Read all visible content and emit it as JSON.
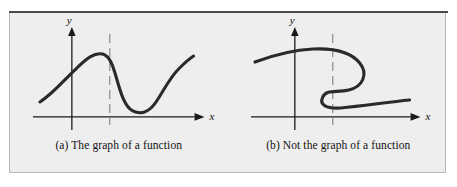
{
  "figure": {
    "background_color": "#eeeeee",
    "frame_border_color": "#b9b9b9",
    "top_rule_color": "#4a4a4a",
    "curve_color": "#2a2a2a",
    "axis_color": "#1a1a1a",
    "dashed_line_color": "#8a8a8a"
  },
  "panels": [
    {
      "id": "panel-a",
      "caption": "(a) The graph of a function",
      "x_axis_label": "x",
      "y_axis_label": "y",
      "passes_vertical_line_test": "yes",
      "dashed_test_line_intersections": 1
    },
    {
      "id": "panel-b",
      "caption": "(b) Not the graph of a function",
      "x_axis_label": "x",
      "y_axis_label": "y",
      "passes_vertical_line_test": "no",
      "dashed_test_line_intersections": 3
    }
  ]
}
